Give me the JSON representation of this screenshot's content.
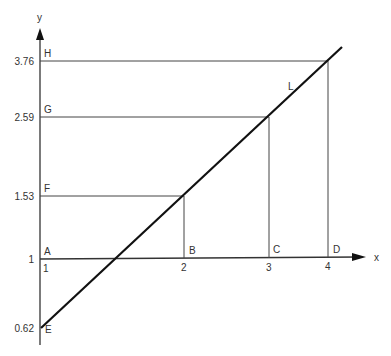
{
  "diagram": {
    "axis_x_label": "x",
    "axis_y_label": "y",
    "line_label": "L",
    "y_ticks": [
      {
        "value": "3.76",
        "point": "H"
      },
      {
        "value": "2.59",
        "point": "G"
      },
      {
        "value": "1.53",
        "point": "F"
      },
      {
        "value": "1",
        "point": "A"
      },
      {
        "value": "0.62",
        "point": "E"
      }
    ],
    "x_ticks": [
      {
        "value": "1",
        "point": "A"
      },
      {
        "value": "2",
        "point": "B"
      },
      {
        "value": "3",
        "point": "C"
      },
      {
        "value": "4",
        "point": "D"
      }
    ],
    "colors": {
      "line": "#111111",
      "axis": "#333333",
      "background": "#ffffff"
    }
  }
}
